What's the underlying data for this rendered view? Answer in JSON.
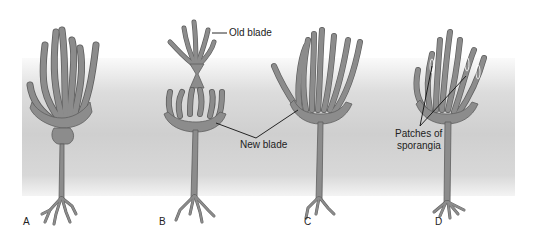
{
  "figure": {
    "panels": [
      {
        "id": "A",
        "label": "A"
      },
      {
        "id": "B",
        "label": "B"
      },
      {
        "id": "C",
        "label": "C"
      },
      {
        "id": "D",
        "label": "D"
      }
    ],
    "annotations": {
      "old_blade": "Old blade",
      "new_blade": "New blade",
      "sporangia_line1": "Patches of",
      "sporangia_line2": "sporangia"
    },
    "colors": {
      "plant_fill": "#8c8c8c",
      "plant_outline": "#5a5a5a",
      "band": "#d2d2d2",
      "text": "#222222"
    }
  }
}
